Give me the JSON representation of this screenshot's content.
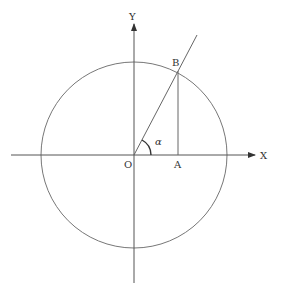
{
  "diagram": {
    "labels": {
      "x_axis": "X",
      "y_axis": "Y",
      "origin": "O",
      "point_a": "A",
      "point_b": "B",
      "angle": "α"
    },
    "colors": {
      "stroke": "#555555",
      "text": "#333333",
      "circle": "#777777"
    },
    "geometry": {
      "origin": [
        134,
        155
      ],
      "radius": 93,
      "point_a": [
        178,
        155
      ],
      "point_b": [
        178,
        71
      ],
      "ray_end": [
        197,
        35
      ],
      "x_axis": [
        11,
        255
      ],
      "y_axis": [
        22,
        283
      ],
      "angle_arc_radius": 17
    }
  }
}
